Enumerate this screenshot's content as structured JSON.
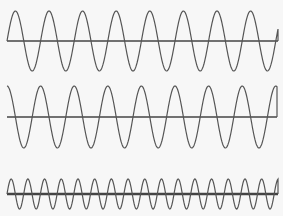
{
  "figure": {
    "background": "#f7f7f7",
    "line_color": "#555555",
    "axis_color": "#444444"
  },
  "waves": [
    {
      "name": "wave-1",
      "x_start": 7,
      "x_end": 278,
      "axis_y": 41,
      "amplitude": 30,
      "period": 33.6,
      "phase_start": "zero-rising",
      "axis_width": 1.3,
      "cycles": 8
    },
    {
      "name": "wave-2",
      "x_start": 7,
      "x_end": 277,
      "axis_y": 117,
      "amplitude": 31,
      "period": 33.6,
      "phase_start": "peak",
      "axis_width": 1.3,
      "cycles": 8
    },
    {
      "name": "wave-3",
      "x_start": 7,
      "x_end": 278,
      "axis_y": 194,
      "amplitude": 15,
      "period": 16.7,
      "phase_start": "zero-rising",
      "axis_width": 2.4,
      "cycles": 16
    }
  ]
}
